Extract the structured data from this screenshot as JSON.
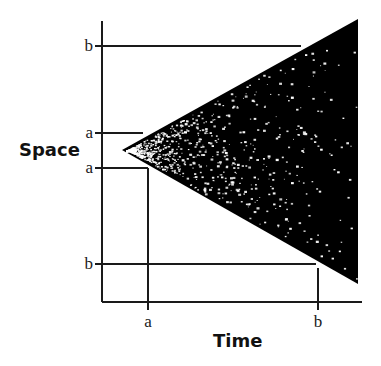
{
  "diagram": {
    "axes": {
      "y_title": "Space",
      "x_title": "Time",
      "origin": [
        102,
        302
      ],
      "y_top": 21,
      "x_right": 362
    },
    "space_markers": [
      {
        "label": "b",
        "y": 46,
        "line_x_end": 301
      },
      {
        "label": "a",
        "y": 133,
        "line_x_end": 143
      },
      {
        "label": "a",
        "y": 168,
        "line_x_end": 148
      },
      {
        "label": "b",
        "y": 264,
        "line_x_end": 316
      }
    ],
    "time_markers": [
      {
        "label": "a",
        "x": 148,
        "line_y_start": 168
      },
      {
        "label": "b",
        "x": 318,
        "line_y_start": 268
      }
    ],
    "wedge": {
      "apex": [
        122,
        150
      ],
      "top_right": [
        358,
        19
      ],
      "bottom_right": [
        358,
        284
      ],
      "fill": "#000000",
      "speckle_color": "#ffffff",
      "speckle_count": 900,
      "speckle_seed": 7
    },
    "colors": {
      "line": "#1a1a1a",
      "background": "#ffffff"
    }
  }
}
